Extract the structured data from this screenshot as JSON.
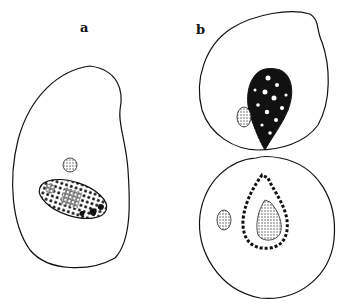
{
  "figure": {
    "panels": [
      {
        "id": "a",
        "label": "a",
        "description": "single cell with nucleus and small granule"
      },
      {
        "id": "b",
        "label": "b",
        "description": "dividing cell with two lobes, each with dark nucleus and small granule"
      }
    ],
    "colors": {
      "ink": "#111111",
      "paper": "#ffffff",
      "stipple": "#555555"
    }
  }
}
